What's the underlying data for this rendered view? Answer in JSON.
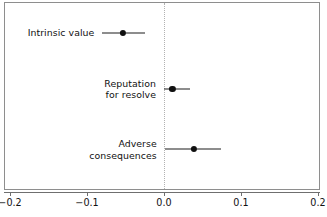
{
  "chart_data": {
    "type": "scatter",
    "title": "",
    "subtitle": "",
    "xlabel": "",
    "ylabel": "",
    "orientation": "horizontal",
    "grid": false,
    "legend": false,
    "zero_reference_line": 0.0,
    "xlim": [
      -0.24,
      0.21
    ],
    "xticks": [
      -0.2,
      -0.1,
      0.0,
      0.1,
      0.2
    ],
    "xticklabels": [
      "−0.2",
      "−0.1",
      "0.0",
      "0.1",
      "0.2"
    ],
    "categories": [
      "Intrinsic value",
      "Reputation for resolve",
      "Adverse consequences"
    ],
    "points": [
      {
        "label": "Intrinsic value",
        "label_lines": [
          "Intrinsic value"
        ],
        "estimate": -0.053,
        "ci_low": -0.08,
        "ci_high": -0.025
      },
      {
        "label": "Reputation for resolve",
        "label_lines": [
          "Reputation",
          "for resolve"
        ],
        "estimate": 0.011,
        "ci_low": 0.0,
        "ci_high": 0.034
      },
      {
        "label": "Adverse consequences",
        "label_lines": [
          "Adverse",
          "consequences"
        ],
        "estimate": 0.039,
        "ci_low": 0.001,
        "ci_high": 0.074
      }
    ],
    "colors": {
      "point": "#101010",
      "errorbar": "#1c1c1c",
      "zero_line": "#b2b2b2",
      "frame": "#8e8e8e",
      "axis": "#6f6f6f",
      "text": "#111111",
      "background": "#ffffff"
    }
  },
  "caption": {
    "text": "",
    "clipped": true
  }
}
